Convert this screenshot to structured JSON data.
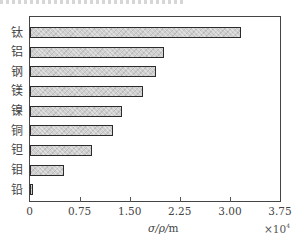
{
  "chart_data": {
    "type": "bar",
    "orientation": "horizontal",
    "title": "",
    "categories": [
      "钛",
      "铝",
      "钢",
      "镁",
      "镍",
      "铜",
      "钽",
      "钼",
      "铅"
    ],
    "values": [
      3.16,
      2.01,
      1.89,
      1.7,
      1.38,
      1.25,
      0.94,
      0.52,
      0.05
    ],
    "value_multiplier": "×10⁴",
    "xlabel": "σ/ρ/m",
    "ylabel": "",
    "xlim": [
      0,
      3.75
    ],
    "xticks": [
      "0",
      "0.75",
      "1.50",
      "2.25",
      "3.00",
      "3.75"
    ],
    "grid": false,
    "legend": null,
    "bar_fill": "#cfcfcf",
    "bar_edge": "#2b2b2b"
  },
  "axis": {
    "xlabel_symbol": "σ/ρ/",
    "xlabel_unit": "m",
    "multiplier_text": "×10",
    "multiplier_exp": "4"
  }
}
